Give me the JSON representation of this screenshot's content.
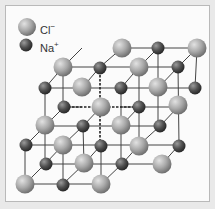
{
  "legend": {
    "items": [
      {
        "symbol": "Cl",
        "charge": "−",
        "type": "cl",
        "x": 27,
        "y": 27,
        "label_x": 40,
        "label_y": 21
      },
      {
        "symbol": "Na",
        "charge": "+",
        "type": "na",
        "x": 26,
        "y": 45,
        "label_x": 40,
        "label_y": 39
      }
    ]
  },
  "colors": {
    "cl_light": "#d6d6d6",
    "cl_mid": "#a8a8a8",
    "cl_dark": "#7a7a7a",
    "na_light": "#8a8a8a",
    "na_mid": "#505050",
    "na_dark": "#2c2c2c",
    "line": "#444444"
  },
  "radii": {
    "cl": 9.5,
    "na": 6.5
  },
  "lines": [
    [
      122,
      48,
      197,
      48
    ],
    [
      63,
      67,
      178,
      67
    ],
    [
      45,
      88,
      195,
      88
    ],
    [
      45,
      126,
      160,
      126
    ],
    [
      25,
      145,
      179,
      145
    ],
    [
      45,
      164,
      162,
      164
    ],
    [
      25,
      184,
      101,
      184
    ],
    [
      64,
      107,
      82,
      107
    ],
    [
      120,
      107,
      178,
      107
    ],
    [
      25,
      145,
      25,
      184
    ],
    [
      45,
      88,
      45,
      164
    ],
    [
      63,
      67,
      63,
      107
    ],
    [
      63,
      145,
      63,
      184
    ],
    [
      83,
      126,
      84,
      164
    ],
    [
      101,
      145,
      101,
      184
    ],
    [
      121,
      88,
      121,
      164
    ],
    [
      139,
      67,
      139,
      145
    ],
    [
      158,
      48,
      158,
      126
    ],
    [
      178,
      67,
      179,
      145
    ],
    [
      197,
      48,
      195,
      88
    ],
    [
      25,
      184,
      45,
      164
    ],
    [
      63,
      184,
      84,
      164
    ],
    [
      101,
      184,
      122,
      164
    ],
    [
      45,
      164,
      63,
      145
    ],
    [
      84,
      164,
      101,
      145
    ],
    [
      122,
      164,
      139,
      145
    ],
    [
      26,
      145,
      45,
      126
    ],
    [
      63,
      145,
      83,
      126
    ],
    [
      139,
      145,
      160,
      126
    ],
    [
      160,
      126,
      178,
      107
    ],
    [
      83,
      126,
      101,
      107
    ],
    [
      45,
      126,
      64,
      107
    ],
    [
      45,
      88,
      63,
      67
    ],
    [
      82,
      88,
      100,
      67
    ],
    [
      121,
      88,
      139,
      67
    ],
    [
      158,
      88,
      178,
      67
    ],
    [
      63,
      67,
      82,
      48
    ],
    [
      100,
      67,
      122,
      48
    ],
    [
      139,
      67,
      158,
      48
    ],
    [
      178,
      67,
      197,
      48
    ],
    [
      121,
      126,
      139,
      107
    ],
    [
      162,
      164,
      179,
      145
    ]
  ],
  "dashed_lines": [
    [
      100,
      67,
      100,
      145
    ],
    [
      64,
      107,
      139,
      107
    ]
  ],
  "atoms": [
    {
      "t": "cl",
      "x": 122,
      "y": 48
    },
    {
      "t": "na",
      "x": 158,
      "y": 48
    },
    {
      "t": "cl",
      "x": 197,
      "y": 48
    },
    {
      "t": "cl",
      "x": 63,
      "y": 67
    },
    {
      "t": "na",
      "x": 100,
      "y": 68
    },
    {
      "t": "cl",
      "x": 139,
      "y": 67
    },
    {
      "t": "na",
      "x": 178,
      "y": 67
    },
    {
      "t": "na",
      "x": 45,
      "y": 88
    },
    {
      "t": "cl",
      "x": 82,
      "y": 87
    },
    {
      "t": "na",
      "x": 121,
      "y": 88
    },
    {
      "t": "cl",
      "x": 158,
      "y": 87
    },
    {
      "t": "na",
      "x": 195,
      "y": 88
    },
    {
      "t": "na",
      "x": 64,
      "y": 107
    },
    {
      "t": "cl",
      "x": 101,
      "y": 107
    },
    {
      "t": "na",
      "x": 139,
      "y": 107
    },
    {
      "t": "cl",
      "x": 178,
      "y": 105
    },
    {
      "t": "cl",
      "x": 45,
      "y": 125
    },
    {
      "t": "na",
      "x": 83,
      "y": 126
    },
    {
      "t": "cl",
      "x": 121,
      "y": 125
    },
    {
      "t": "na",
      "x": 160,
      "y": 126
    },
    {
      "t": "na",
      "x": 26,
      "y": 145
    },
    {
      "t": "cl",
      "x": 63,
      "y": 145
    },
    {
      "t": "na",
      "x": 101,
      "y": 146
    },
    {
      "t": "cl",
      "x": 139,
      "y": 146
    },
    {
      "t": "na",
      "x": 179,
      "y": 146
    },
    {
      "t": "na",
      "x": 46,
      "y": 164
    },
    {
      "t": "cl",
      "x": 84,
      "y": 163
    },
    {
      "t": "na",
      "x": 122,
      "y": 164
    },
    {
      "t": "cl",
      "x": 162,
      "y": 164
    },
    {
      "t": "cl",
      "x": 25,
      "y": 184
    },
    {
      "t": "na",
      "x": 63,
      "y": 185
    },
    {
      "t": "cl",
      "x": 101,
      "y": 184
    }
  ]
}
